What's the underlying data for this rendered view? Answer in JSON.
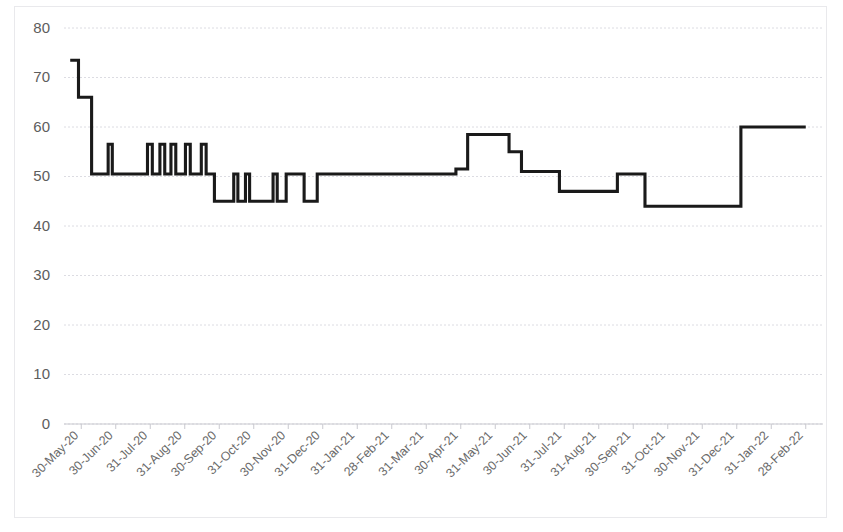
{
  "chart_data": {
    "type": "line",
    "line_style": "step-post",
    "title": "",
    "subtitle": "",
    "xlabel": "",
    "ylabel": "",
    "ylim": [
      0,
      80
    ],
    "ytick_step": 10,
    "ytick_labels": [
      "0",
      "10",
      "20",
      "30",
      "40",
      "50",
      "60",
      "70",
      "80"
    ],
    "ytick_values": [
      0,
      10,
      20,
      30,
      40,
      50,
      60,
      70,
      80
    ],
    "grid": true,
    "grid_axis": "y",
    "legend": false,
    "legend_position": "none",
    "series_name": "Value",
    "series_color": "#1a1a1a",
    "categories": [
      "30-May-20",
      "30-Jun-20",
      "31-Jul-20",
      "31-Aug-20",
      "30-Sep-20",
      "31-Oct-20",
      "30-Nov-20",
      "31-Dec-20",
      "31-Jan-21",
      "28-Feb-21",
      "31-Mar-21",
      "30-Apr-21",
      "31-May-21",
      "30-Jun-21",
      "31-Jul-21",
      "31-Aug-21",
      "30-Sep-21",
      "31-Oct-21",
      "30-Nov-21",
      "31-Dec-21",
      "31-Jan-22",
      "28-Feb-22"
    ],
    "x_axis_range": [
      0,
      22
    ],
    "points": [
      {
        "x": 0.18,
        "y": 73.5
      },
      {
        "x": 0.42,
        "y": 73.5
      },
      {
        "x": 0.42,
        "y": 66.0
      },
      {
        "x": 0.8,
        "y": 66.0
      },
      {
        "x": 0.8,
        "y": 50.5
      },
      {
        "x": 1.28,
        "y": 50.5
      },
      {
        "x": 1.28,
        "y": 56.5
      },
      {
        "x": 1.4,
        "y": 56.5
      },
      {
        "x": 1.4,
        "y": 50.5
      },
      {
        "x": 2.42,
        "y": 50.5
      },
      {
        "x": 2.42,
        "y": 56.5
      },
      {
        "x": 2.56,
        "y": 56.5
      },
      {
        "x": 2.56,
        "y": 50.5
      },
      {
        "x": 2.78,
        "y": 50.5
      },
      {
        "x": 2.78,
        "y": 56.5
      },
      {
        "x": 2.92,
        "y": 56.5
      },
      {
        "x": 2.92,
        "y": 50.5
      },
      {
        "x": 3.1,
        "y": 50.5
      },
      {
        "x": 3.1,
        "y": 56.5
      },
      {
        "x": 3.24,
        "y": 56.5
      },
      {
        "x": 3.24,
        "y": 50.5
      },
      {
        "x": 3.52,
        "y": 50.5
      },
      {
        "x": 3.52,
        "y": 56.5
      },
      {
        "x": 3.66,
        "y": 56.5
      },
      {
        "x": 3.66,
        "y": 50.5
      },
      {
        "x": 3.98,
        "y": 50.5
      },
      {
        "x": 3.98,
        "y": 56.5
      },
      {
        "x": 4.12,
        "y": 56.5
      },
      {
        "x": 4.12,
        "y": 50.5
      },
      {
        "x": 4.36,
        "y": 50.5
      },
      {
        "x": 4.36,
        "y": 45.0
      },
      {
        "x": 4.92,
        "y": 45.0
      },
      {
        "x": 4.92,
        "y": 50.5
      },
      {
        "x": 5.04,
        "y": 50.5
      },
      {
        "x": 5.04,
        "y": 45.0
      },
      {
        "x": 5.26,
        "y": 45.0
      },
      {
        "x": 5.26,
        "y": 50.5
      },
      {
        "x": 5.38,
        "y": 50.5
      },
      {
        "x": 5.38,
        "y": 45.0
      },
      {
        "x": 6.06,
        "y": 45.0
      },
      {
        "x": 6.06,
        "y": 50.5
      },
      {
        "x": 6.18,
        "y": 50.5
      },
      {
        "x": 6.18,
        "y": 45.0
      },
      {
        "x": 6.44,
        "y": 45.0
      },
      {
        "x": 6.44,
        "y": 50.5
      },
      {
        "x": 6.96,
        "y": 50.5
      },
      {
        "x": 6.96,
        "y": 45.0
      },
      {
        "x": 7.34,
        "y": 45.0
      },
      {
        "x": 7.34,
        "y": 50.5
      },
      {
        "x": 11.36,
        "y": 50.5
      },
      {
        "x": 11.36,
        "y": 51.5
      },
      {
        "x": 11.7,
        "y": 51.5
      },
      {
        "x": 11.7,
        "y": 58.5
      },
      {
        "x": 12.9,
        "y": 58.5
      },
      {
        "x": 12.9,
        "y": 55.0
      },
      {
        "x": 13.26,
        "y": 55.0
      },
      {
        "x": 13.26,
        "y": 51.0
      },
      {
        "x": 14.36,
        "y": 51.0
      },
      {
        "x": 14.36,
        "y": 47.0
      },
      {
        "x": 16.04,
        "y": 47.0
      },
      {
        "x": 16.04,
        "y": 50.5
      },
      {
        "x": 16.84,
        "y": 50.5
      },
      {
        "x": 16.84,
        "y": 44.0
      },
      {
        "x": 19.62,
        "y": 44.0
      },
      {
        "x": 19.62,
        "y": 60.0
      },
      {
        "x": 21.5,
        "y": 60.0
      }
    ],
    "annotations": [],
    "notes": {
      "start_value": 73.5,
      "end_value": 60.0,
      "min_value": 44.0,
      "max_value": 73.5
    }
  },
  "plot_geometry": {
    "left": 64,
    "right": 823,
    "top": 28,
    "bottom": 424
  }
}
